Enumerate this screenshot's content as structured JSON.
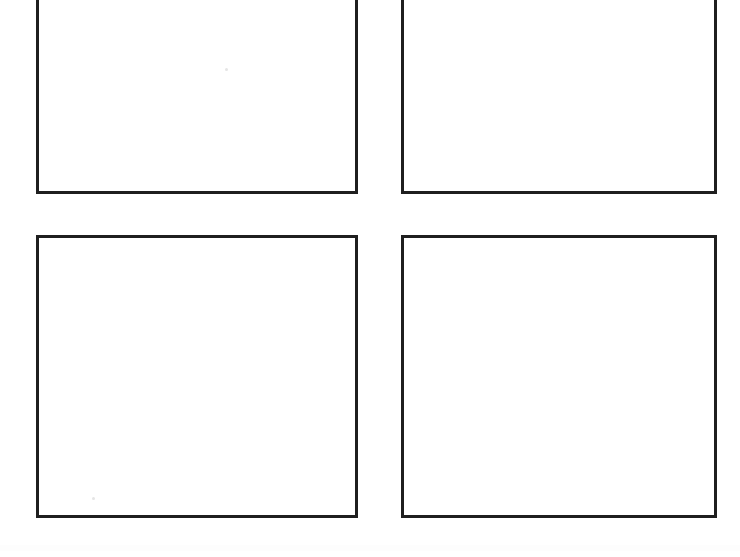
{
  "page": {
    "background_color": "#ffffff",
    "width": 740,
    "height": 557,
    "content_text": "",
    "caption_text": "",
    "notes_text": ""
  },
  "style": {
    "border_color": "#1f1f1f",
    "border_width_px": 3,
    "panel_fill_color": "#ffffff",
    "speck_color": "#cfcfcf"
  },
  "panels": [
    {
      "id": "panel-top-left",
      "label": "",
      "caption": "",
      "content": "",
      "cropped_top": true,
      "x": 36,
      "y": -10,
      "width": 322,
      "height": 204
    },
    {
      "id": "panel-top-right",
      "label": "",
      "caption": "",
      "content": "",
      "cropped_top": true,
      "x": 401,
      "y": -10,
      "width": 316,
      "height": 204
    },
    {
      "id": "panel-bottom-left",
      "label": "",
      "caption": "",
      "content": "",
      "cropped_top": false,
      "x": 36,
      "y": 235,
      "width": 322,
      "height": 283
    },
    {
      "id": "panel-bottom-right",
      "label": "",
      "caption": "",
      "content": "",
      "cropped_top": false,
      "x": 401,
      "y": 235,
      "width": 316,
      "height": 283
    }
  ],
  "specks": [
    {
      "x": 225,
      "y": 68,
      "size": 3
    },
    {
      "x": 92,
      "y": 497,
      "size": 3
    }
  ],
  "scan_noise": {
    "y": 545,
    "height": 6
  }
}
